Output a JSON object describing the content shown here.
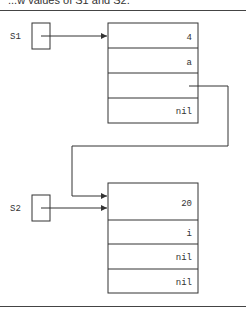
{
  "caption": "...w values of S1 and S2.",
  "pointers": [
    {
      "label": "S1"
    },
    {
      "label": "S2"
    }
  ],
  "nodes": [
    {
      "name": "S1-node",
      "fields": [
        "4",
        "a",
        "",
        "nil"
      ]
    },
    {
      "name": "S2-node",
      "fields": [
        "20",
        "i",
        "nil",
        "nil"
      ]
    }
  ],
  "colors": {
    "line": "#333333",
    "background": "#ffffff"
  }
}
